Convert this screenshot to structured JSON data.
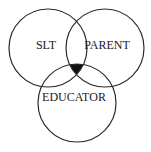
{
  "diagram": {
    "type": "venn",
    "circles": [
      {
        "id": "slt",
        "label": "SLT",
        "cx": 48,
        "cy": 48,
        "r": 39
      },
      {
        "id": "parent",
        "label": "PARENT",
        "cx": 105,
        "cy": 48,
        "r": 39
      },
      {
        "id": "educator",
        "label": "EDUCATOR",
        "cx": 77,
        "cy": 103,
        "r": 39
      }
    ],
    "labels": {
      "slt": "SLT",
      "parent": "PARENT",
      "educator": "EDUCATOR"
    },
    "intersection": {
      "description": "shared region of all three circles",
      "fill_color": "#111111"
    },
    "stroke_color": "#2a2a2a",
    "text_color": "#1a1a1a"
  }
}
